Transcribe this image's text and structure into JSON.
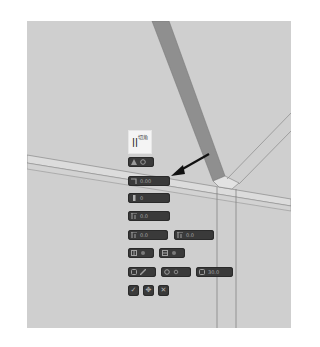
{
  "viewport": {
    "background": "#cfcfcf",
    "beam_color": "#8f8f8f",
    "edge_color": "#7a7a7a"
  },
  "label_box": {
    "bars": "||",
    "text": "切角"
  },
  "toolbar": {
    "rows": [
      {
        "chips": [
          {
            "icon": "angle-icon",
            "secondary_icon": "settings-icon",
            "value": ""
          }
        ]
      },
      {
        "chips": [
          {
            "icon": "offset-icon",
            "value": "0.00"
          }
        ]
      },
      {
        "chips": [
          {
            "icon": "height-icon",
            "value": "0"
          }
        ]
      },
      {
        "chips": [
          {
            "icon": "chamfer-icon",
            "value": "0.0"
          }
        ]
      },
      {
        "chips": [
          {
            "icon": "chamfer-start-icon",
            "value": "0.0"
          },
          {
            "icon": "chamfer-end-icon",
            "value": "0.0"
          }
        ]
      },
      {
        "chips": [
          {
            "icon": "grid-a-icon",
            "secondary_icon": "toggle-icon",
            "value": ""
          },
          {
            "icon": "grid-b-icon",
            "secondary_icon": "toggle-icon",
            "value": ""
          }
        ]
      },
      {
        "chips": [
          {
            "icon": "layer-icon",
            "secondary_icon": "brush-icon",
            "value": ""
          },
          {
            "icon": "snap-icon",
            "secondary_icon": "settings-icon",
            "value": ""
          },
          {
            "icon": "rotate-icon",
            "value": "30.0"
          }
        ]
      }
    ],
    "actions": [
      {
        "name": "confirm-button",
        "icon": "check-icon",
        "glyph": "✓"
      },
      {
        "name": "move-button",
        "icon": "move-icon",
        "glyph": "✥"
      },
      {
        "name": "cancel-button",
        "icon": "close-icon",
        "glyph": "✕"
      }
    ]
  }
}
